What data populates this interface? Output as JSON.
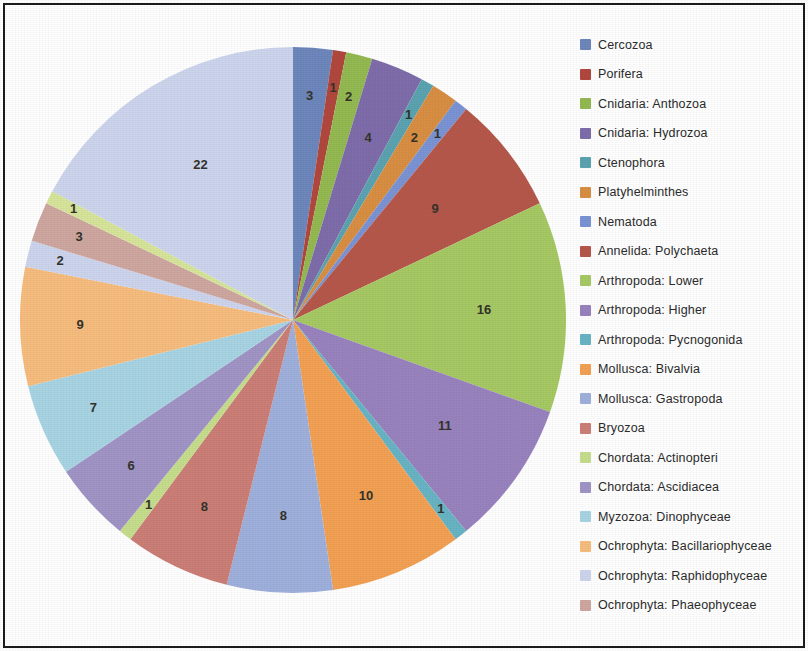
{
  "figure": {
    "border_color": "#1c1c1c",
    "background": "#ffffff"
  },
  "legend": {
    "position": "right",
    "items": [
      {
        "label": "Cercozoa",
        "color": "#6e87bd"
      },
      {
        "label": "Porifera",
        "color": "#b1483e"
      },
      {
        "label": "Cnidaria: Anthozoa",
        "color": "#94ba52"
      },
      {
        "label": "Cnidaria: Hydrozoa",
        "color": "#7e6daa"
      },
      {
        "label": "Ctenophora",
        "color": "#5ba3b0"
      },
      {
        "label": "Platyhelminthes",
        "color": "#d98f43"
      },
      {
        "label": "Nematoda",
        "color": "#7b94d4"
      },
      {
        "label": "Annelida: Polychaeta",
        "color": "#b5584b"
      },
      {
        "label": "Arthropoda: Lower",
        "color": "#a6c964"
      },
      {
        "label": "Arthropoda: Higher",
        "color": "#9983bf"
      },
      {
        "label": "Arthropoda: Pycnogonida",
        "color": "#68b4c4"
      },
      {
        "label": "Mollusca: Bivalvia",
        "color": "#f3a154"
      },
      {
        "label": "Mollusca: Gastropoda",
        "color": "#9fb0dc"
      },
      {
        "label": "Bryozoa",
        "color": "#cb7f77"
      },
      {
        "label": "Chordata: Actinopteri",
        "color": "#c6dd8c"
      },
      {
        "label": "Chordata: Ascidiacea",
        "color": "#a195c6"
      },
      {
        "label": "Myzozoa: Dinophyceae",
        "color": "#a8d4e3"
      },
      {
        "label": "Ochrophyta: Bacillariophyceae",
        "color": "#f7bd7f"
      },
      {
        "label": "Ochrophyta: Raphidophyceae",
        "color": "#cdd5ee"
      },
      {
        "label": "Ochrophyta: Phaeophyceae",
        "color": "#cfa7a1"
      }
    ]
  },
  "chart_data": {
    "type": "pie",
    "title": "",
    "start_angle_deg": 0,
    "direction": "clockwise",
    "total": 126,
    "show_data_labels": true,
    "labels": [
      "Cercozoa",
      "Porifera",
      "Cnidaria: Anthozoa",
      "Cnidaria: Hydrozoa",
      "Ctenophora",
      "Platyhelminthes",
      "Nematoda",
      "Annelida: Polychaeta",
      "Arthropoda: Lower",
      "Arthropoda: Higher",
      "Arthropoda: Pycnogonida",
      "Mollusca: Bivalvia",
      "Mollusca: Gastropoda",
      "Bryozoa",
      "Chordata: Actinopteri",
      "Chordata: Ascidiacea",
      "Myzozoa: Dinophyceae",
      "Ochrophyta: Bacillariophyceae",
      "Ochrophyta: Raphidophyceae",
      "Ochrophyta: Phaeophyceae",
      "Chordata: Actinopteri",
      "Ochrophyta: Raphidophyceae"
    ],
    "values": [
      3,
      1,
      2,
      4,
      1,
      2,
      1,
      9,
      16,
      11,
      1,
      10,
      8,
      8,
      1,
      6,
      7,
      9,
      2,
      3,
      1,
      22
    ],
    "colors": [
      "#6e87bd",
      "#b1483e",
      "#94ba52",
      "#7e6daa",
      "#5ba3b0",
      "#d98f43",
      "#7b94d4",
      "#b5584b",
      "#a6c964",
      "#9983bf",
      "#68b4c4",
      "#f3a154",
      "#9fb0dc",
      "#cb7f77",
      "#c6dd8c",
      "#a195c6",
      "#a8d4e3",
      "#f7bd7f",
      "#cdd5ee",
      "#cfa7a1",
      "#d7e59b",
      "#cdd5ee"
    ],
    "data_labels": [
      "3",
      "1",
      "2",
      "4",
      "1",
      "2",
      "1",
      "9",
      "16",
      "11",
      "1",
      "10",
      "8",
      "8",
      "1",
      "6",
      "7",
      "9",
      "2",
      "3",
      "1",
      "22"
    ],
    "label_radius_fraction": [
      0.82,
      0.86,
      0.84,
      0.72,
      0.86,
      0.8,
      0.86,
      0.66,
      0.7,
      0.68,
      0.88,
      0.7,
      0.72,
      0.76,
      0.86,
      0.8,
      0.8,
      0.78,
      0.88,
      0.84,
      0.9,
      0.66
    ],
    "legend_position": "right",
    "grid": false
  }
}
